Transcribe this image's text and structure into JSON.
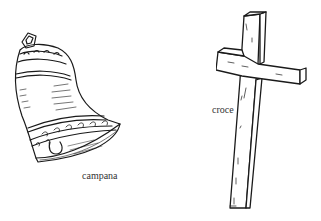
{
  "items": [
    {
      "name": "bell",
      "label": "campana"
    },
    {
      "name": "cross",
      "label": "croce"
    }
  ],
  "colors": {
    "ink": "#1a1a1a",
    "label": "#333333",
    "background": "#ffffff"
  }
}
